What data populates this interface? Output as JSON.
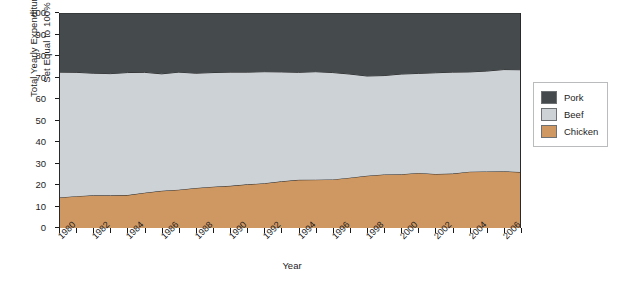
{
  "chart_data": {
    "type": "area",
    "stacked": true,
    "percent": true,
    "title": "",
    "xlabel": "Year",
    "ylabel": "Total Yearly Expenditures\nSet Equal to 100%",
    "xlim": [
      1980,
      2007
    ],
    "ylim": [
      0,
      100
    ],
    "yticks": [
      0,
      10,
      20,
      30,
      40,
      50,
      60,
      70,
      80,
      90,
      100
    ],
    "xticks": [
      1980,
      1981,
      1982,
      1983,
      1984,
      1985,
      1986,
      1987,
      1988,
      1989,
      1990,
      1991,
      1992,
      1993,
      1994,
      1995,
      1996,
      1997,
      1998,
      1999,
      2000,
      2001,
      2002,
      2003,
      2004,
      2005,
      2006,
      2007
    ],
    "xtick_labels": [
      "1980",
      "1982",
      "1984",
      "1986",
      "1988",
      "1990",
      "1992",
      "1994",
      "1996",
      "1998",
      "2000",
      "2002",
      "2004",
      "2006"
    ],
    "xtick_label_years": [
      1980,
      1982,
      1984,
      1986,
      1988,
      1990,
      1992,
      1994,
      1996,
      1998,
      2000,
      2002,
      2004,
      2006
    ],
    "grid": false,
    "legend_position": "right",
    "x": [
      1980,
      1981,
      1982,
      1983,
      1984,
      1985,
      1986,
      1987,
      1988,
      1989,
      1990,
      1991,
      1992,
      1993,
      1994,
      1995,
      1996,
      1997,
      1998,
      1999,
      2000,
      2001,
      2002,
      2003,
      2004,
      2005,
      2006,
      2007
    ],
    "series": [
      {
        "name": "Chicken",
        "color": "#cf9761",
        "values": [
          14.2,
          14.8,
          15.2,
          15.2,
          15.3,
          16.4,
          17.3,
          17.8,
          18.6,
          19.2,
          19.6,
          20.3,
          20.8,
          21.7,
          22.4,
          22.5,
          22.6,
          23.4,
          24.3,
          24.9,
          25.0,
          25.6,
          25.1,
          25.3,
          26.2,
          26.3,
          26.4,
          26.0
        ]
      },
      {
        "name": "Beef",
        "color": "#cdd2d6",
        "values": [
          58.3,
          57.6,
          56.8,
          56.6,
          57.0,
          56.0,
          54.4,
          54.7,
          53.4,
          53.1,
          52.9,
          52.2,
          51.9,
          50.9,
          50.0,
          50.2,
          49.7,
          48.2,
          46.4,
          46.0,
          46.6,
          46.3,
          47.1,
          47.2,
          46.4,
          46.7,
          47.3,
          47.6
        ]
      },
      {
        "name": "Pork",
        "color": "#454a4d",
        "values": [
          27.5,
          27.6,
          28.0,
          28.2,
          27.7,
          27.6,
          28.3,
          27.5,
          28.0,
          27.7,
          27.5,
          27.5,
          27.3,
          27.4,
          27.6,
          27.3,
          27.7,
          28.4,
          29.3,
          29.1,
          28.4,
          28.1,
          27.8,
          27.5,
          27.4,
          27.0,
          26.3,
          26.4
        ]
      }
    ],
    "cumulative_top_boundaries": {
      "chicken_top": [
        14.2,
        14.8,
        15.2,
        15.2,
        15.3,
        16.4,
        17.3,
        17.8,
        18.6,
        19.2,
        19.6,
        20.3,
        20.8,
        21.7,
        22.4,
        22.5,
        22.6,
        23.4,
        24.3,
        24.9,
        25.0,
        25.6,
        25.1,
        25.3,
        26.2,
        26.3,
        26.4,
        26.0
      ],
      "beef_top": [
        72.5,
        72.4,
        72.0,
        71.8,
        72.3,
        72.4,
        71.7,
        72.5,
        72.0,
        72.3,
        72.5,
        72.5,
        72.7,
        72.6,
        72.4,
        72.7,
        72.3,
        71.6,
        70.7,
        70.9,
        71.6,
        71.9,
        72.2,
        72.5,
        72.6,
        73.0,
        73.7,
        73.6
      ],
      "pork_top": [
        100,
        100,
        100,
        100,
        100,
        100,
        100,
        100,
        100,
        100,
        100,
        100,
        100,
        100,
        100,
        100,
        100,
        100,
        100,
        100,
        100,
        100,
        100,
        100,
        100,
        100,
        100,
        100
      ]
    }
  },
  "legend": {
    "items": [
      {
        "label": "Pork",
        "color": "#454a4d"
      },
      {
        "label": "Beef",
        "color": "#cdd2d6"
      },
      {
        "label": "Chicken",
        "color": "#cf9761"
      }
    ]
  },
  "axes": {
    "y_title": "Total Yearly Expenditures\nSet Equal to 100%",
    "x_title": "Year"
  }
}
